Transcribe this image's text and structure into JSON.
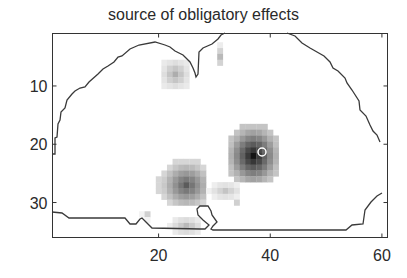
{
  "chart_data": {
    "type": "heatmap",
    "title": "source of obligatory effects",
    "xlabel": "",
    "ylabel": "",
    "xlim": [
      1,
      61
    ],
    "ylim": [
      36,
      1
    ],
    "y_axis_reversed": true,
    "grid": false,
    "legend": null,
    "colormap": "gray (white = 0, black = max)",
    "xticks": [
      20,
      40,
      60
    ],
    "yticks": [
      10,
      20,
      30
    ],
    "xtick_labels": [
      "20",
      "40",
      "60"
    ],
    "ytick_labels": [
      "10",
      "20",
      "30"
    ],
    "annotations": [
      {
        "type": "brain-outline-contour",
        "description": "black contour line outlining coronal brain section"
      },
      {
        "type": "circle-marker",
        "color": "#ffffff",
        "x": 39,
        "y": 22,
        "description": "small white circle marking peak source"
      }
    ],
    "clusters": [
      {
        "name": "right peak",
        "center_x": 37,
        "center_y": 22,
        "x_range": [
          33,
          41
        ],
        "y_range": [
          17,
          26
        ],
        "max_intensity": 1.0
      },
      {
        "name": "left cluster",
        "center_x": 25,
        "center_y": 27,
        "x_range": [
          20,
          28
        ],
        "y_range": [
          23,
          30
        ],
        "max_intensity": 0.7
      },
      {
        "name": "upper-left cluster",
        "center_x": 23,
        "center_y": 8,
        "x_range": [
          21,
          25
        ],
        "y_range": [
          6,
          10
        ],
        "max_intensity": 0.35
      },
      {
        "name": "upper-mid streak",
        "center_x": 31,
        "center_y": 5,
        "x_range": [
          31,
          31
        ],
        "y_range": [
          3,
          6
        ],
        "max_intensity": 0.3
      },
      {
        "name": "mid-right streak",
        "center_x": 32,
        "center_y": 28,
        "x_range": [
          29,
          34
        ],
        "y_range": [
          27,
          29
        ],
        "max_intensity": 0.25
      },
      {
        "name": "lower cluster",
        "center_x": 25,
        "center_y": 34,
        "x_range": [
          22,
          27
        ],
        "y_range": [
          33,
          35
        ],
        "max_intensity": 0.3
      },
      {
        "name": "lower-left speck",
        "center_x": 18,
        "center_y": 32,
        "x_range": [
          17,
          18
        ],
        "y_range": [
          32,
          33
        ],
        "max_intensity": 0.2
      },
      {
        "name": "lower-right speck",
        "center_x": 34,
        "center_y": 30,
        "x_range": [
          34,
          34
        ],
        "y_range": [
          30,
          30
        ],
        "max_intensity": 0.2
      }
    ]
  }
}
